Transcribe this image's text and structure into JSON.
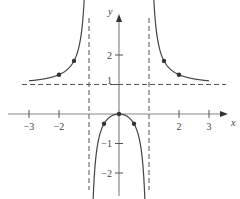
{
  "chart_data": {
    "type": "line",
    "title": "",
    "function": "y = x^2/(x^2 - 1)",
    "xlabel": "x",
    "ylabel": "y",
    "xlim": [
      -3.3,
      3.3
    ],
    "ylim": [
      -2.4,
      3.6
    ],
    "grid": false,
    "x_ticks": [
      {
        "value": -3,
        "label": "−3"
      },
      {
        "value": -2,
        "label": "−2"
      },
      {
        "value": 2,
        "label": "2"
      },
      {
        "value": 3,
        "label": "3"
      }
    ],
    "y_ticks": [
      {
        "value": 2,
        "label": "2"
      },
      {
        "value": 1,
        "label": "1"
      },
      {
        "value": -1,
        "label": "−1"
      },
      {
        "value": -2,
        "label": "−2"
      }
    ],
    "asymptotes": {
      "vertical": [
        -1,
        1
      ],
      "horizontal": [
        1
      ]
    },
    "series": [
      {
        "name": "left branch",
        "x_range": [
          -3,
          -1.13
        ]
      },
      {
        "name": "middle branch",
        "x_range": [
          -0.9,
          0.9
        ]
      },
      {
        "name": "right branch",
        "x_range": [
          1.13,
          3
        ]
      }
    ],
    "marked_points": [
      {
        "x": -2,
        "y": 1.333
      },
      {
        "x": -1.5,
        "y": 1.8
      },
      {
        "x": -0.5,
        "y": -0.333
      },
      {
        "x": 0,
        "y": 0
      },
      {
        "x": 0.5,
        "y": -0.333
      },
      {
        "x": 1.5,
        "y": 1.8
      },
      {
        "x": 2,
        "y": 1.333
      }
    ]
  }
}
